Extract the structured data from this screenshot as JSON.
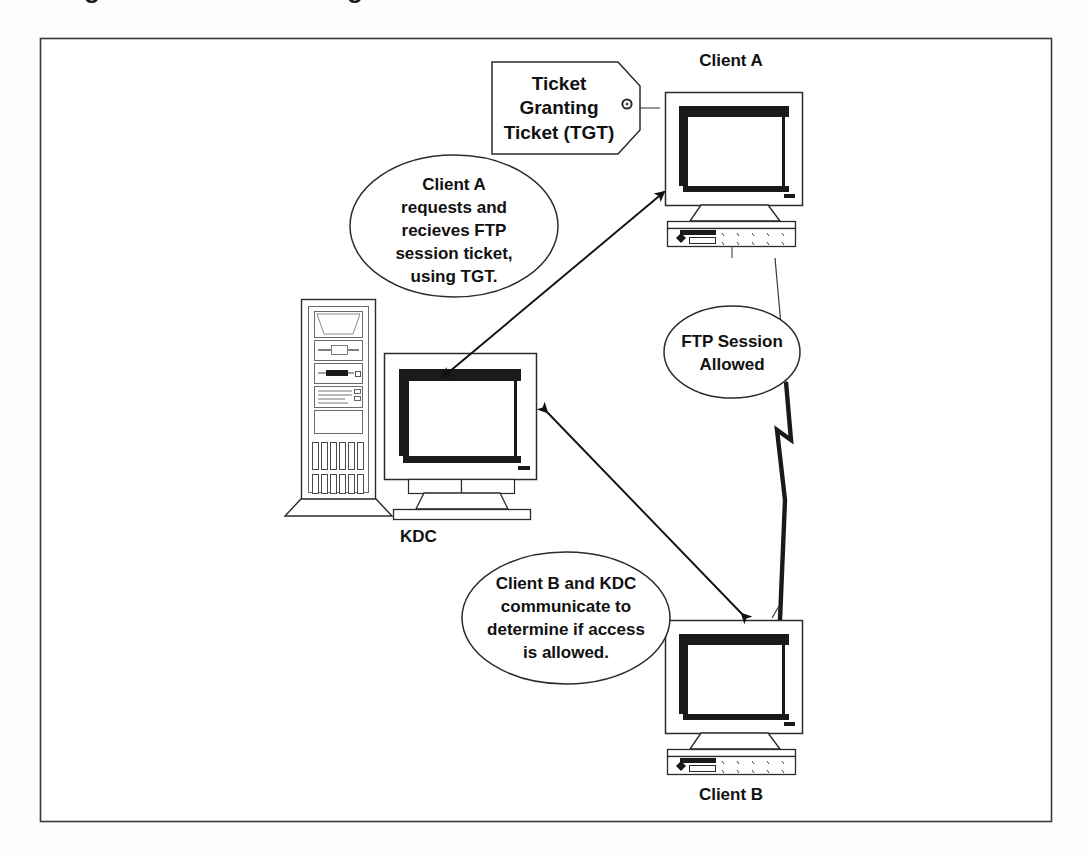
{
  "figure": {
    "background_color": "#fdfdfd",
    "border_color": "#3a3a3a",
    "ink_color": "#111111",
    "cropped_header_text": "Figure 5-3  Kerberos logon"
  },
  "tag": {
    "name": "ticket-granting-ticket-tag",
    "line1": "Ticket",
    "line2": "Granting",
    "line3": "Ticket (TGT)"
  },
  "nodes": {
    "client_a": {
      "label": "Client A"
    },
    "kdc": {
      "label": "KDC"
    },
    "client_b": {
      "label": "Client B"
    }
  },
  "callouts": [
    {
      "id": "callout-client-a-request",
      "lines": [
        "Client A",
        "requests and",
        "recieves FTP",
        "session ticket,",
        "using TGT."
      ]
    },
    {
      "id": "callout-ftp-session",
      "lines": [
        "FTP Session",
        "Allowed"
      ]
    },
    {
      "id": "callout-client-b-kdc",
      "lines": [
        "Client B and KDC",
        "communicate to",
        "determine if access",
        "is allowed."
      ]
    }
  ],
  "connectors": [
    {
      "id": "arrow-kdc-client-a",
      "style": "double-headed-arrow"
    },
    {
      "id": "arrow-kdc-client-b",
      "style": "double-headed-arrow"
    },
    {
      "id": "lightning-client-a-client-b",
      "style": "lightning-bolt"
    },
    {
      "id": "leader-tag-to-client-a",
      "style": "thin-line"
    }
  ]
}
